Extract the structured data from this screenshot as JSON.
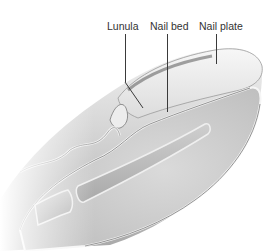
{
  "figure": {
    "labels": [
      {
        "id": "lunula",
        "text": "Lunula"
      },
      {
        "id": "nail-bed",
        "text": "Nail bed"
      },
      {
        "id": "nail-plate",
        "text": "Nail plate"
      }
    ]
  },
  "colors": {
    "background": "#ffffff",
    "skin_light": "#e6e6e6",
    "skin_mid": "#c8c8c8",
    "skin_dark": "#8a8a8a",
    "tissue": "#d2d2d2",
    "bone": "#bdbdbd",
    "nail": "#efefef",
    "label_text": "#333333"
  }
}
